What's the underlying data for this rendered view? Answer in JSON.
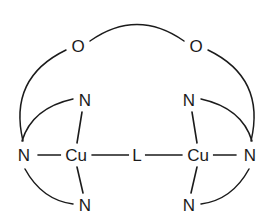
{
  "figure": {
    "background_color": "#ffffff",
    "line_color": "#1b1b1b",
    "width": 274,
    "height": 224
  },
  "atoms": {
    "cu_left": {
      "label": "Cu",
      "x": 76,
      "y": 155
    },
    "cu_right": {
      "label": "Cu",
      "x": 198,
      "y": 155
    },
    "bridge": {
      "label": "L",
      "x": 137,
      "y": 155
    },
    "o_left": {
      "label": "O",
      "x": 78,
      "y": 46
    },
    "o_right": {
      "label": "O",
      "x": 196,
      "y": 46
    },
    "n_left_outer": {
      "label": "N",
      "x": 24,
      "y": 155
    },
    "n_right_outer": {
      "label": "N",
      "x": 250,
      "y": 155
    },
    "n_left_upper": {
      "label": "N",
      "x": 85,
      "y": 100
    },
    "n_right_upper": {
      "label": "N",
      "x": 189,
      "y": 100
    },
    "n_left_lower": {
      "label": "N",
      "x": 85,
      "y": 205
    },
    "n_right_lower": {
      "label": "N",
      "x": 189,
      "y": 205
    }
  },
  "bonds": {
    "straight": [
      {
        "name": "bond-n-left-outer-to-cu-left",
        "x1": 38,
        "y1": 155,
        "x2": 62,
        "y2": 155
      },
      {
        "name": "bond-cu-left-to-bridge",
        "x1": 92,
        "y1": 155,
        "x2": 129,
        "y2": 155
      },
      {
        "name": "bond-bridge-to-cu-right",
        "x1": 145,
        "y1": 155,
        "x2": 182,
        "y2": 155
      },
      {
        "name": "bond-cu-right-to-n-right-outer",
        "x1": 212,
        "y1": 155,
        "x2": 236,
        "y2": 155
      },
      {
        "name": "bond-n-left-upper-to-cu-left",
        "x1": 82,
        "y1": 112,
        "x2": 77,
        "y2": 143
      },
      {
        "name": "bond-cu-left-to-n-left-lower",
        "x1": 77,
        "y1": 167,
        "x2": 83,
        "y2": 193
      },
      {
        "name": "bond-n-right-upper-to-cu-right",
        "x1": 192,
        "y1": 112,
        "x2": 197,
        "y2": 143
      },
      {
        "name": "bond-cu-right-to-n-right-lower",
        "x1": 197,
        "y1": 167,
        "x2": 191,
        "y2": 193
      }
    ],
    "arcs": [
      {
        "name": "arc-o-left-to-o-right",
        "d": "M 90 41 Q 137 8 184 41"
      },
      {
        "name": "arc-o-left-to-n-left-outer",
        "d": "M 66 50 Q 8 78 23 141"
      },
      {
        "name": "arc-n-left-upper-to-n-left-outer",
        "d": "M 73 99 Q 32 108 22 141"
      },
      {
        "name": "arc-n-left-outer-to-n-left-lower",
        "d": "M 25 169 Q 42 200 73 204"
      },
      {
        "name": "arc-o-right-to-n-right-outer",
        "d": "M 208 50 Q 266 78 251 141"
      },
      {
        "name": "arc-n-right-upper-to-n-right-outer",
        "d": "M 201 99 Q 242 108 252 141"
      },
      {
        "name": "arc-n-right-outer-to-n-right-lower",
        "d": "M 249 169 Q 232 200 201 204"
      }
    ]
  }
}
